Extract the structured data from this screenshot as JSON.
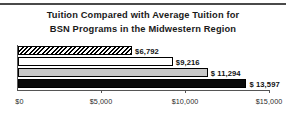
{
  "chart_data": {
    "type": "bar",
    "orientation": "horizontal",
    "title": "Tuition Compared with Average Tuition for BSN Programs in the Midwestern Region",
    "title_line1": "Tuition Compared with Average Tuition for",
    "title_line2": "BSN Programs in the Midwestern Region",
    "xlabel": "",
    "ylabel": "",
    "xlim": [
      0,
      15000
    ],
    "grid": false,
    "legend": false,
    "categories": [
      "Series 1",
      "Series 2",
      "Series 3",
      "Series 4"
    ],
    "values": [
      6792,
      9216,
      11294,
      13597
    ],
    "data_labels": [
      "$6,792",
      "$9,216",
      "$ 11,294",
      "$ 13,597"
    ],
    "fills": [
      "diagonal-hatch",
      "white",
      "light-gray",
      "black"
    ],
    "xticks": [
      0,
      5000,
      10000,
      15000
    ],
    "xtick_labels": [
      "$0",
      "$5,000",
      "$10,000",
      "$15,000"
    ],
    "colors": {
      "axis": "#555555",
      "bar_outline": "#000000",
      "bar_gray": "#c8c8c8",
      "bar_black": "#0a0a0a",
      "text": "#111111",
      "top_rule": "#4a4a4a",
      "background": "#ffffff"
    }
  }
}
